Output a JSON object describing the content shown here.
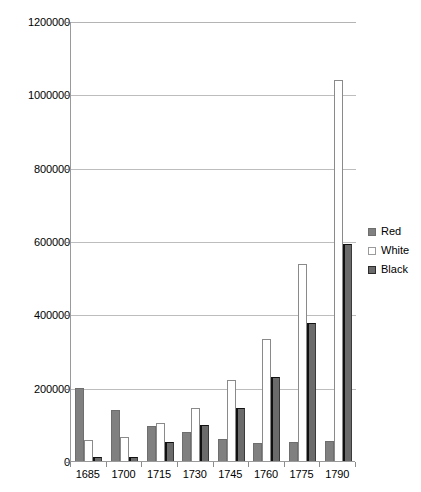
{
  "chart_data": {
    "type": "bar",
    "title": "",
    "subtitle": "",
    "xlabel": "",
    "ylabel": "",
    "categories": [
      "1685",
      "1700",
      "1715",
      "1730",
      "1745",
      "1760",
      "1775",
      "1790"
    ],
    "series": [
      {
        "name": "Red",
        "color": "#808080",
        "values": [
          200000,
          138000,
          95000,
          80000,
          60000,
          50000,
          52000,
          55000
        ]
      },
      {
        "name": "White",
        "color": "#ffffff",
        "values": [
          58000,
          65000,
          103000,
          145000,
          220000,
          333000,
          538000,
          1040000
        ]
      },
      {
        "name": "Black",
        "color": "#6b6b6b",
        "values": [
          10000,
          12000,
          52000,
          98000,
          145000,
          228000,
          377000,
          592000
        ]
      }
    ],
    "ylim": [
      0,
      1200000
    ],
    "ytick_values": [
      0,
      200000,
      400000,
      600000,
      800000,
      1000000,
      1200000
    ],
    "ytick_labels": [
      "0",
      "200000",
      "400000",
      "600000",
      "800000",
      "1000000",
      "1200000"
    ],
    "grid": true,
    "grid_axis": "y",
    "legend_position": "right",
    "legend_entries": [
      "Red",
      "White",
      "Black"
    ]
  },
  "axes": {
    "y": {
      "ticks": [
        {
          "label": "1200000",
          "value": 1200000
        },
        {
          "label": "1000000",
          "value": 1000000
        },
        {
          "label": "800000",
          "value": 800000
        },
        {
          "label": "600000",
          "value": 600000
        },
        {
          "label": "400000",
          "value": 400000
        },
        {
          "label": "200000",
          "value": 200000
        },
        {
          "label": "0",
          "value": 0
        }
      ]
    },
    "x": {
      "ticks": [
        {
          "label": "1685"
        },
        {
          "label": "1700"
        },
        {
          "label": "1715"
        },
        {
          "label": "1730"
        },
        {
          "label": "1745"
        },
        {
          "label": "1760"
        },
        {
          "label": "1775"
        },
        {
          "label": "1790"
        }
      ]
    }
  },
  "legend": {
    "items": [
      {
        "label": "Red",
        "swatch": "red-swatch-icon"
      },
      {
        "label": "White",
        "swatch": "white-swatch-icon"
      },
      {
        "label": "Black",
        "swatch": "black-swatch-icon"
      }
    ]
  }
}
